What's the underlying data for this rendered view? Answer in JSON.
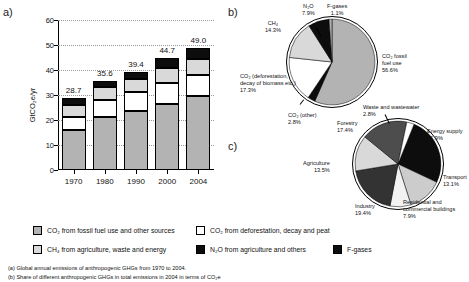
{
  "panels": {
    "a": "a)",
    "b": "b)",
    "c": "c)"
  },
  "chart_data": [
    {
      "type": "bar",
      "panel": "a)",
      "title": "Global annual emissions of anthropogenic GHGs from 1970 to 2004",
      "xlabel": "",
      "ylabel": "GtCO2eq/yr",
      "ylim": [
        0,
        60
      ],
      "yticks": [
        0,
        10,
        20,
        30,
        40,
        50,
        60
      ],
      "grid": true,
      "stacked": true,
      "categories": [
        "1970",
        "1980",
        "1990",
        "2000",
        "2004"
      ],
      "totals": [
        "28.7",
        "35.6",
        "39.4",
        "44.7",
        "49.0"
      ],
      "series": [
        {
          "name": "CO2 from fossil fuel use and other sources",
          "color": "#b3b3b3",
          "values": [
            15.9,
            21.1,
            23.8,
            26.5,
            29.6
          ]
        },
        {
          "name": "CO2 from deforestation, decay and peat",
          "color": "#ffffff",
          "values": [
            5.4,
            6.9,
            7.5,
            8.5,
            8.5
          ]
        },
        {
          "name": "CH4 from agriculture, waste and energy",
          "color": "#d9d9d9",
          "values": [
            4.9,
            5.3,
            5.2,
            5.8,
            6.4
          ]
        },
        {
          "name": "N2O from agriculture and others",
          "color": "#0d0d0d",
          "values": [
            2.5,
            2.3,
            2.9,
            3.9,
            4.5
          ]
        }
      ]
    },
    {
      "type": "pie",
      "panel": "b)",
      "title": "Share of different anthropogenic GHGs in total emissions in 2004 in terms of CO2eq",
      "legend": "outside",
      "slices": [
        {
          "label": "CO2 fossil fuel use",
          "value": 56.6,
          "pct": "56.6%",
          "color": "#b3b3b3"
        },
        {
          "label": "CO2 (other)",
          "value": 2.8,
          "pct": "2.8%",
          "color": "#0d0d0d"
        },
        {
          "label": "CO2 (deforestation, decay of biomass etc.)",
          "value": 17.3,
          "pct": "17.3%",
          "color": "#ffffff"
        },
        {
          "label": "CH4",
          "value": 14.3,
          "pct": "14.3%",
          "color": "#d9d9d9"
        },
        {
          "label": "N2O",
          "value": 7.9,
          "pct": "7.9%",
          "color": "#0d0d0d"
        },
        {
          "label": "F-gases",
          "value": 1.1,
          "pct": "1.1%",
          "color": "#b3b3b3"
        }
      ]
    },
    {
      "type": "pie",
      "panel": "c)",
      "title": "Share of different sectors in total anthropogenic GHG emissions in 2004 in terms of CO2eq",
      "legend": "outside",
      "slices": [
        {
          "label": "Energy supply",
          "value": 25.9,
          "pct": "25.9%",
          "color": "#0d0d0d"
        },
        {
          "label": "Transport",
          "value": 13.1,
          "pct": "13.1%",
          "color": "#cccccc"
        },
        {
          "label": "Residential and commercial buildings",
          "value": 7.9,
          "pct": "7.9%",
          "color": "#f2f2f2"
        },
        {
          "label": "Industry",
          "value": 19.4,
          "pct": "19.4%",
          "color": "#333333"
        },
        {
          "label": "Agriculture",
          "value": 13.5,
          "pct": "13.5%",
          "color": "#d9d9d9"
        },
        {
          "label": "Forestry",
          "value": 17.4,
          "pct": "17.4%",
          "color": "#4d4d4d"
        },
        {
          "label": "Waste and wastewater",
          "value": 2.8,
          "pct": "2.8%",
          "color": "#ffffff"
        }
      ]
    }
  ],
  "pie_b_labels": {
    "n2o": {
      "name": "N₂O",
      "pct": "7.9%"
    },
    "fgases": {
      "name": "F-gases",
      "pct": "1.1%"
    },
    "ch4": {
      "name": "CH₄",
      "pct": "14.3%"
    },
    "co2_fossil": {
      "line1": "CO₂ fossil",
      "line2": "fuel use",
      "pct": "56.6%"
    },
    "co2_defor": {
      "line1": "CO₂ (deforestation,",
      "line2": "decay of biomass etc.)",
      "pct": "17.3%"
    },
    "co2_other": {
      "name": "CO₂ (other)",
      "pct": "2.8%"
    }
  },
  "pie_c_labels": {
    "waste": {
      "name": "Waste and wastewater",
      "pct": "2.8%"
    },
    "energy": {
      "name": "Energy supply",
      "pct": "25.9%"
    },
    "transport": {
      "name": "Transport",
      "pct": "13.1%"
    },
    "residential": {
      "line1": "Residential and",
      "line2": "commercial buildings",
      "pct": "7.9%"
    },
    "industry": {
      "name": "Industry",
      "pct": "19.4%"
    },
    "agriculture": {
      "name": "Agriculture",
      "pct": "13.5%"
    },
    "forestry": {
      "name": "Forestry",
      "pct": "17.4%"
    }
  },
  "legend": {
    "items": [
      {
        "key": "co2-fossil",
        "swatch": "g1",
        "label": "CO₂ from fossil fuel use and other sources"
      },
      {
        "key": "co2-deforestation",
        "swatch": "g2",
        "label": "CO₂ from deforestation, decay and peat"
      },
      {
        "key": "ch4",
        "swatch": "g3",
        "label": "CH₄ from agriculture, waste and energy"
      },
      {
        "key": "n2o",
        "swatch": "g4",
        "label": "N₂O from agriculture and others"
      },
      {
        "key": "f-gases",
        "swatch": "g5",
        "label": "F-gases"
      }
    ]
  },
  "caption": {
    "line_a": "(a) Global annual emissions of anthropogenic GHGs from 1970 to 2004.",
    "line_b": "(b) Share of different anthropogenic GHGs in total emissions in 2004 in terms of CO₂e"
  },
  "axis": {
    "ylabel": "GtCO₂e/yr",
    "yticks": [
      "0",
      "10",
      "20",
      "30",
      "40",
      "50",
      "60"
    ]
  }
}
